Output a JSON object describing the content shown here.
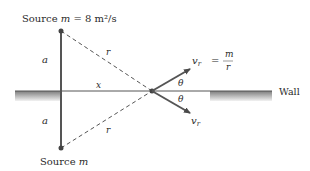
{
  "diagram": {
    "top_source_label": "Source ",
    "top_source_m": "m",
    "top_source_eq": " = 8 m²/s",
    "bottom_source_label": "Source ",
    "bottom_source_m": "m",
    "a_upper": "a",
    "a_lower": "a",
    "r_upper": "r",
    "r_lower": "r",
    "x_label": "x",
    "theta_upper": "θ",
    "theta_lower": "θ",
    "vr_upper": "v",
    "vr_upper_sub": "r",
    "vr_equals": "=",
    "frac_num": "m",
    "frac_den": "r",
    "vr_lower": "v",
    "vr_lower_sub": "r",
    "wall_label": "Wall"
  },
  "colors": {
    "line": "#4a4a4a",
    "wall_shade_top": "#8a8a8a",
    "wall_shade_bottom": "#e8e8e8"
  }
}
